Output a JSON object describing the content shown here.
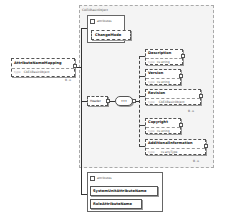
{
  "diagram": {
    "root": {
      "name": "AttributeNameMapping",
      "type_label": "type",
      "type": "CAEXBasicObject",
      "cardinality": "0..∞"
    },
    "base_type_group": {
      "label": "CAEXBasicObject"
    },
    "attributes_top": {
      "label": "attributes",
      "items": [
        "ChangeMode"
      ]
    },
    "header": {
      "name": "Header",
      "sequence_symbol": "•••"
    },
    "children": [
      {
        "name": "Description",
        "type_label": "type",
        "type": "xs:string",
        "cardinality": ""
      },
      {
        "name": "Version",
        "type_label": "type",
        "type": "xs:string",
        "cardinality": ""
      },
      {
        "name": "Revision",
        "type_label": "type",
        "type": "CAEXBasicObject",
        "cardinality": "0..∞"
      },
      {
        "name": "Copyright",
        "type_label": "type",
        "type": "xs:string",
        "cardinality": ""
      },
      {
        "name": "AdditionalInformation",
        "type_label": "type",
        "type": "xs:anyType",
        "cardinality": "0..∞"
      }
    ],
    "attributes_bottom": {
      "label": "attributes",
      "items": [
        "SystemUnitAttributeName",
        "RoleAttributeName"
      ]
    }
  }
}
